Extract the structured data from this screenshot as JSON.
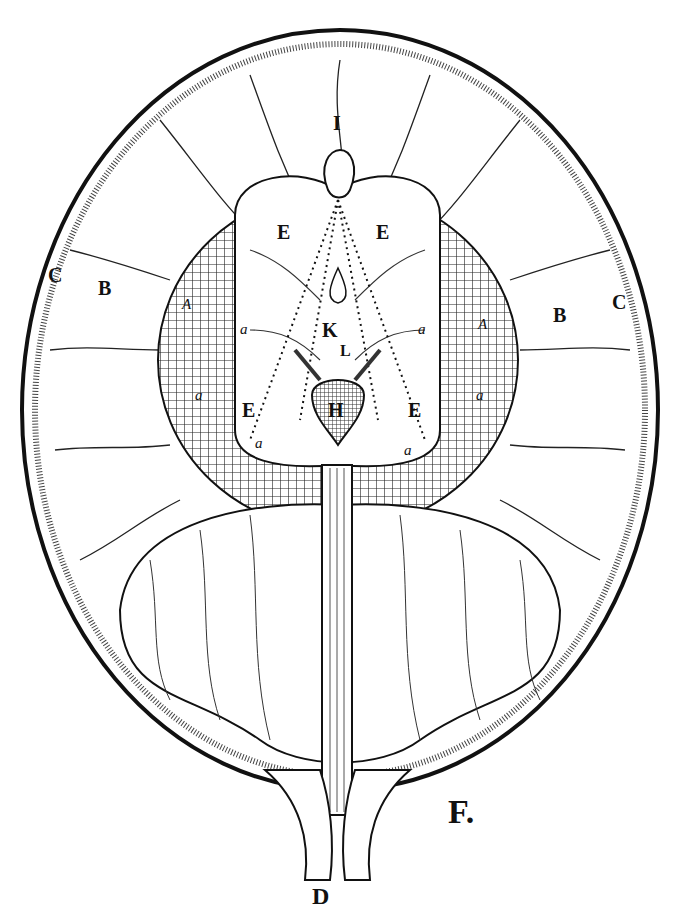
{
  "figure": {
    "caption": "F.",
    "labels": {
      "I": "I",
      "E": "E",
      "K": "K",
      "L": "L",
      "H": "H",
      "A": "A",
      "B": "B",
      "C": "C",
      "D": "D",
      "a": "a"
    }
  }
}
